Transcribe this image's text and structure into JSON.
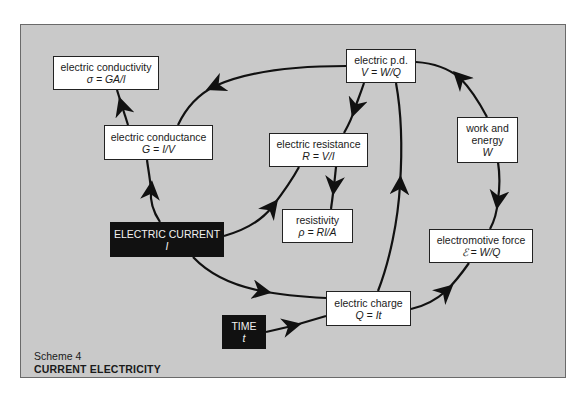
{
  "diagram": {
    "caption": {
      "scheme": "Scheme 4",
      "title": "CURRENT ELECTRICITY"
    },
    "nodes": {
      "conductivity": {
        "label": "electric conductivity",
        "formula": "σ = GA/l"
      },
      "pd": {
        "label": "electric p.d.",
        "formula": "V = W/Q"
      },
      "conductance": {
        "label": "electric conductance",
        "formula": "G = I/V"
      },
      "resistance": {
        "label": "electric resistance",
        "formula": "R = V/I"
      },
      "work": {
        "label": "work and",
        "label2": "energy",
        "formula": "W"
      },
      "resistivity": {
        "label": "resistivity",
        "formula": "ρ = Rl/A"
      },
      "current": {
        "label": "ELECTRIC CURRENT",
        "formula": "I"
      },
      "emf": {
        "label": "electromotive force",
        "formula": "ℰ = W/Q"
      },
      "charge": {
        "label": "electric charge",
        "formula": "Q = It"
      },
      "time": {
        "label": "TIME",
        "formula": "t"
      }
    },
    "edges": [
      {
        "from": "pd",
        "to": "conductance"
      },
      {
        "from": "conductance",
        "to": "conductivity"
      },
      {
        "from": "current",
        "to": "conductance"
      },
      {
        "from": "pd",
        "to": "resistance"
      },
      {
        "from": "current",
        "to": "resistance"
      },
      {
        "from": "resistance",
        "to": "resistivity"
      },
      {
        "from": "charge",
        "to": "pd"
      },
      {
        "from": "work",
        "to": "pd"
      },
      {
        "from": "work",
        "to": "emf"
      },
      {
        "from": "charge",
        "to": "emf"
      },
      {
        "from": "current",
        "to": "charge"
      },
      {
        "from": "time",
        "to": "charge"
      }
    ],
    "colors": {
      "background": "#c9c9c9",
      "box": "#ffffff",
      "dark_box": "#111111",
      "line": "#111111"
    }
  }
}
